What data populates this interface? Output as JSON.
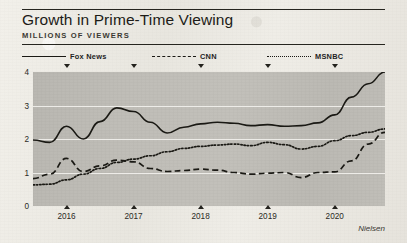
{
  "header": {
    "title": "Growth in Prime-Time Viewing",
    "subtitle": "MILLIONS OF VIEWERS"
  },
  "source_note": "Nielsen",
  "legend": [
    {
      "label": "Fox News",
      "style": "solid"
    },
    {
      "label": "CNN",
      "style": "dashed"
    },
    {
      "label": "MSNBC",
      "style": "dotted"
    }
  ],
  "colors": {
    "ink": "#1a1914",
    "plot_background": "#bfbdb7",
    "gridline": "#f6f5f1",
    "paper": "#eceae4"
  },
  "chart_data": {
    "type": "line",
    "title": "Growth in Prime-Time Viewing",
    "subtitle": "MILLIONS OF VIEWERS",
    "xlabel": "",
    "ylabel": "Millions of viewers",
    "xlim": [
      2015.5,
      2020.75
    ],
    "ylim": [
      0,
      4
    ],
    "yticks": [
      0,
      1,
      2,
      3,
      4
    ],
    "ytick_labels": [
      "0",
      "1",
      "2",
      "3",
      "4"
    ],
    "xticks": [
      2016,
      2017,
      2018,
      2019,
      2020
    ],
    "xtick_labels": [
      "2016",
      "2017",
      "2018",
      "2019",
      "2020"
    ],
    "grid": "horizontal",
    "legend_position": "above-plot",
    "source": "Nielsen",
    "x": [
      2015.5,
      2015.75,
      2016.0,
      2016.25,
      2016.5,
      2016.75,
      2017.0,
      2017.25,
      2017.5,
      2017.75,
      2018.0,
      2018.25,
      2018.5,
      2018.75,
      2019.0,
      2019.25,
      2019.5,
      2019.75,
      2020.0,
      2020.25,
      2020.5,
      2020.75
    ],
    "series": [
      {
        "name": "Fox News",
        "style": "solid",
        "values": [
          1.97,
          1.9,
          2.38,
          2.0,
          2.52,
          2.93,
          2.82,
          2.5,
          2.18,
          2.35,
          2.45,
          2.5,
          2.47,
          2.4,
          2.43,
          2.38,
          2.4,
          2.48,
          2.72,
          3.25,
          3.65,
          4.0
        ]
      },
      {
        "name": "CNN",
        "style": "dashed",
        "values": [
          0.82,
          0.95,
          1.42,
          1.03,
          1.2,
          1.37,
          1.32,
          1.12,
          1.03,
          1.06,
          1.1,
          1.07,
          1.0,
          0.95,
          0.98,
          1.0,
          0.85,
          1.0,
          1.02,
          1.35,
          1.85,
          2.2
        ]
      },
      {
        "name": "MSNBC",
        "style": "dotted",
        "values": [
          0.63,
          0.65,
          0.78,
          0.95,
          1.12,
          1.3,
          1.4,
          1.5,
          1.62,
          1.72,
          1.78,
          1.82,
          1.85,
          1.8,
          1.9,
          1.83,
          1.7,
          1.78,
          1.95,
          2.1,
          2.2,
          2.3
        ]
      }
    ]
  }
}
